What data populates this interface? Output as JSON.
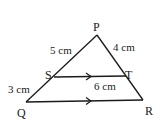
{
  "diagram": {
    "title": "",
    "stroke_color": "#1a1a1a",
    "background": "#ffffff",
    "points": {
      "P": {
        "label": "P",
        "x": 97,
        "y": 35
      },
      "Q": {
        "label": "Q",
        "x": 26,
        "y": 102
      },
      "R": {
        "label": "R",
        "x": 143,
        "y": 100
      },
      "S": {
        "label": "S",
        "x": 54,
        "y": 77
      },
      "T": {
        "label": "T",
        "x": 126,
        "y": 76
      }
    },
    "segments": [
      {
        "from": "P",
        "to": "Q"
      },
      {
        "from": "P",
        "to": "R"
      },
      {
        "from": "Q",
        "to": "R",
        "parallel_arrow": true
      },
      {
        "from": "S",
        "to": "T",
        "parallel_arrow": true
      }
    ],
    "measurements": {
      "PS": "5 cm",
      "PT": "4 cm",
      "SQ": "3 cm",
      "ST": "6 cm"
    }
  }
}
